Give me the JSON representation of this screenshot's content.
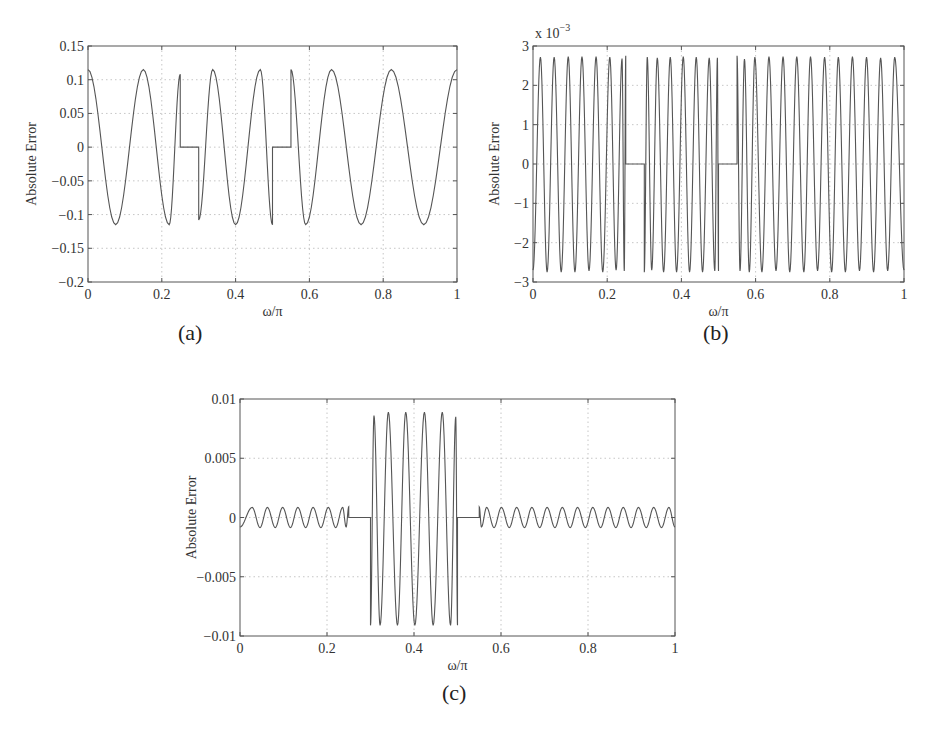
{
  "figure": {
    "captions": [
      "(a)",
      "(b)",
      "(c)"
    ]
  },
  "chart_data": [
    {
      "id": "a",
      "type": "line",
      "title": "",
      "caption": "(a)",
      "xlabel": "ω/π",
      "ylabel": "Absolute Error",
      "xlim": [
        0,
        1
      ],
      "ylim": [
        -0.2,
        0.15
      ],
      "xticks": [
        0,
        0.2,
        0.4,
        0.6,
        0.8,
        1
      ],
      "xtick_labels": [
        "0",
        "0.2",
        "0.4",
        "0.6",
        "0.8",
        "1"
      ],
      "yticks": [
        0.15,
        0.1,
        0.05,
        0,
        -0.05,
        -0.1,
        -0.15,
        -0.2
      ],
      "ytick_labels": [
        "0.15",
        "0.1",
        "0.05",
        "0",
        "−0.05",
        "−0.1",
        "−0.15",
        "−0.2"
      ],
      "y_scale_label": "",
      "grid": true,
      "line_color": "#555555",
      "bands": [
        {
          "x": [
            0,
            0.25
          ],
          "extrema": [
            [
              0,
              0.115
            ],
            [
              0.075,
              -0.115
            ],
            [
              0.15,
              0.115
            ],
            [
              0.22,
              -0.115
            ],
            [
              0.25,
              0.108
            ]
          ]
        },
        {
          "x": [
            0.25,
            0.3
          ],
          "value": 0
        },
        {
          "x": [
            0.3,
            0.5
          ],
          "extrema": [
            [
              0.3,
              -0.108
            ],
            [
              0.338,
              0.115
            ],
            [
              0.4,
              -0.115
            ],
            [
              0.467,
              0.115
            ],
            [
              0.5,
              -0.115
            ]
          ]
        },
        {
          "x": [
            0.5,
            0.55
          ],
          "value": 0
        },
        {
          "x": [
            0.55,
            1.0
          ],
          "extrema": [
            [
              0.55,
              0.115
            ],
            [
              0.59,
              -0.115
            ],
            [
              0.66,
              0.115
            ],
            [
              0.74,
              -0.115
            ],
            [
              0.822,
              0.115
            ],
            [
              0.91,
              -0.115
            ],
            [
              1.0,
              0.115
            ]
          ]
        }
      ],
      "frame": {
        "left": 88,
        "top": 46,
        "width": 369,
        "height": 236
      }
    },
    {
      "id": "b",
      "type": "line",
      "title": "",
      "caption": "(b)",
      "xlabel": "ω/π",
      "ylabel": "Absolute Error",
      "xlim": [
        0,
        1
      ],
      "ylim": [
        -3,
        3
      ],
      "xticks": [
        0,
        0.2,
        0.4,
        0.6,
        0.8,
        1
      ],
      "xtick_labels": [
        "0",
        "0.2",
        "0.4",
        "0.6",
        "0.8",
        "1"
      ],
      "yticks": [
        3,
        2,
        1,
        0,
        -1,
        -2,
        -3
      ],
      "ytick_labels": [
        "3",
        "2",
        "1",
        "0",
        "−1",
        "−2",
        "−3"
      ],
      "y_scale_label": "x 10",
      "y_scale_exponent": "−3",
      "grid": true,
      "line_color": "#555555",
      "bands": [
        {
          "x": [
            0,
            0.25
          ],
          "extrema": [
            [
              0,
              -2.7
            ],
            [
              0.02,
              2.72
            ],
            [
              0.038,
              -2.75
            ],
            [
              0.057,
              2.72
            ],
            [
              0.076,
              -2.75
            ],
            [
              0.095,
              2.73
            ],
            [
              0.113,
              -2.75
            ],
            [
              0.132,
              2.73
            ],
            [
              0.151,
              -2.72
            ],
            [
              0.17,
              2.73
            ],
            [
              0.188,
              -2.75
            ],
            [
              0.207,
              2.72
            ],
            [
              0.224,
              -2.7
            ],
            [
              0.24,
              2.68
            ],
            [
              0.246,
              -2.72
            ],
            [
              0.25,
              2.75
            ]
          ]
        },
        {
          "x": [
            0.25,
            0.3
          ],
          "value": 0
        },
        {
          "x": [
            0.3,
            0.5
          ],
          "extrema": [
            [
              0.3,
              -2.75
            ],
            [
              0.308,
              2.72
            ],
            [
              0.32,
              -2.7
            ],
            [
              0.335,
              2.7
            ],
            [
              0.352,
              -2.75
            ],
            [
              0.37,
              2.72
            ],
            [
              0.387,
              -2.75
            ],
            [
              0.405,
              2.73
            ],
            [
              0.422,
              -2.75
            ],
            [
              0.44,
              2.72
            ],
            [
              0.457,
              -2.75
            ],
            [
              0.475,
              2.7
            ],
            [
              0.49,
              -2.72
            ],
            [
              0.497,
              2.7
            ],
            [
              0.5,
              -2.72
            ]
          ]
        },
        {
          "x": [
            0.5,
            0.55
          ],
          "value": 0
        },
        {
          "x": [
            0.55,
            1.0
          ],
          "extrema": [
            [
              0.55,
              2.75
            ],
            [
              0.558,
              -2.72
            ],
            [
              0.57,
              2.67
            ],
            [
              0.583,
              -2.75
            ],
            [
              0.598,
              2.72
            ],
            [
              0.617,
              -2.75
            ],
            [
              0.636,
              2.73
            ],
            [
              0.655,
              -2.72
            ],
            [
              0.674,
              2.73
            ],
            [
              0.692,
              -2.75
            ],
            [
              0.711,
              2.73
            ],
            [
              0.73,
              -2.75
            ],
            [
              0.748,
              2.73
            ],
            [
              0.767,
              -2.72
            ],
            [
              0.786,
              2.72
            ],
            [
              0.805,
              -2.75
            ],
            [
              0.823,
              2.72
            ],
            [
              0.842,
              -2.75
            ],
            [
              0.861,
              2.73
            ],
            [
              0.88,
              -2.72
            ],
            [
              0.899,
              2.72
            ],
            [
              0.918,
              -2.75
            ],
            [
              0.937,
              2.7
            ],
            [
              0.956,
              -2.72
            ],
            [
              0.975,
              2.72
            ],
            [
              1.0,
              -2.7
            ]
          ]
        }
      ],
      "frame": {
        "left": 533,
        "top": 46,
        "width": 371,
        "height": 236
      }
    },
    {
      "id": "c",
      "type": "line",
      "title": "",
      "caption": "(c)",
      "xlabel": "ω/π",
      "ylabel": "Absolute Error",
      "xlim": [
        0,
        1
      ],
      "ylim": [
        -0.01,
        0.01
      ],
      "xticks": [
        0,
        0.2,
        0.4,
        0.6,
        0.8,
        1
      ],
      "xtick_labels": [
        "0",
        "0.2",
        "0.4",
        "0.6",
        "0.8",
        "1"
      ],
      "yticks": [
        0.01,
        0.005,
        0,
        -0.005,
        -0.01
      ],
      "ytick_labels": [
        "0.01",
        "0.005",
        "0",
        "−0.005",
        "−0.01"
      ],
      "y_scale_label": "",
      "grid": true,
      "line_color": "#555555",
      "bands": [
        {
          "x": [
            0,
            0.25
          ],
          "extrema": [
            [
              0,
              -0.0008
            ],
            [
              0.028,
              0.00085
            ],
            [
              0.046,
              -0.00085
            ],
            [
              0.063,
              0.00085
            ],
            [
              0.081,
              -0.00085
            ],
            [
              0.098,
              0.00085
            ],
            [
              0.116,
              -0.00085
            ],
            [
              0.133,
              0.00085
            ],
            [
              0.151,
              -0.00085
            ],
            [
              0.168,
              0.00085
            ],
            [
              0.186,
              -0.00085
            ],
            [
              0.203,
              0.00085
            ],
            [
              0.22,
              -0.00085
            ],
            [
              0.236,
              0.00085
            ],
            [
              0.244,
              -0.0008
            ],
            [
              0.25,
              0.0009
            ]
          ]
        },
        {
          "x": [
            0.25,
            0.3
          ],
          "value": 0
        },
        {
          "x": [
            0.3,
            0.5
          ],
          "extrema": [
            [
              0.3,
              -0.0091
            ],
            [
              0.308,
              0.0086
            ],
            [
              0.322,
              -0.0091
            ],
            [
              0.341,
              0.0089
            ],
            [
              0.362,
              -0.0091
            ],
            [
              0.381,
              0.0089
            ],
            [
              0.402,
              -0.0091
            ],
            [
              0.424,
              0.0089
            ],
            [
              0.444,
              -0.0091
            ],
            [
              0.465,
              0.0089
            ],
            [
              0.484,
              -0.0091
            ],
            [
              0.496,
              0.0085
            ],
            [
              0.5,
              -0.0091
            ]
          ]
        },
        {
          "x": [
            0.5,
            0.55
          ],
          "value": 0
        },
        {
          "x": [
            0.55,
            1.0
          ],
          "extrema": [
            [
              0.55,
              0.0009
            ],
            [
              0.555,
              -0.0008
            ],
            [
              0.567,
              0.00085
            ],
            [
              0.584,
              -0.00085
            ],
            [
              0.601,
              0.00085
            ],
            [
              0.619,
              -0.00085
            ],
            [
              0.636,
              0.00085
            ],
            [
              0.654,
              -0.00085
            ],
            [
              0.671,
              0.00085
            ],
            [
              0.689,
              -0.00085
            ],
            [
              0.706,
              0.00085
            ],
            [
              0.724,
              -0.00085
            ],
            [
              0.741,
              0.00085
            ],
            [
              0.759,
              -0.00085
            ],
            [
              0.776,
              0.00085
            ],
            [
              0.794,
              -0.00085
            ],
            [
              0.811,
              0.00085
            ],
            [
              0.829,
              -0.00085
            ],
            [
              0.846,
              0.00085
            ],
            [
              0.864,
              -0.00085
            ],
            [
              0.881,
              0.00085
            ],
            [
              0.899,
              -0.00085
            ],
            [
              0.916,
              0.00085
            ],
            [
              0.934,
              -0.00085
            ],
            [
              0.951,
              0.00085
            ],
            [
              0.969,
              -0.00085
            ],
            [
              0.986,
              0.00085
            ],
            [
              1.0,
              -0.0008
            ]
          ]
        }
      ],
      "frame": {
        "left": 240,
        "top": 399,
        "width": 435,
        "height": 237
      }
    }
  ]
}
